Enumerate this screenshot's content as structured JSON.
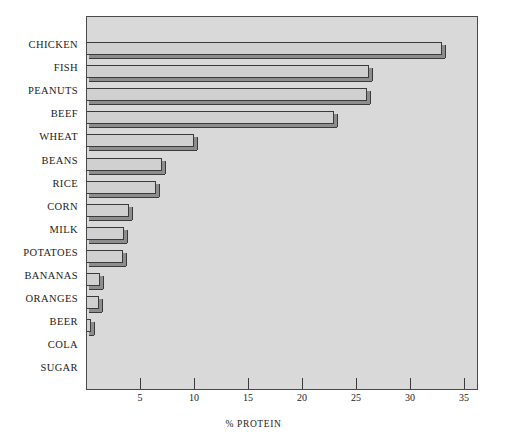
{
  "chart_data": {
    "type": "bar",
    "orientation": "horizontal",
    "title": "",
    "xlabel": "% PROTEIN",
    "ylabel": "",
    "xlim": [
      0,
      36.3
    ],
    "xticks": [
      5,
      10,
      15,
      20,
      25,
      30,
      35
    ],
    "grid": false,
    "legend": null,
    "categories": [
      "CHICKEN",
      "FISH",
      "PEANUTS",
      "BEEF",
      "WHEAT",
      "BEANS",
      "RICE",
      "CORN",
      "MILK",
      "POTATOES",
      "BANANAS",
      "ORANGES",
      "BEER",
      "COLA",
      "SUGAR"
    ],
    "values": [
      33,
      26.2,
      26,
      23,
      10,
      7,
      6.5,
      4,
      3.5,
      3.4,
      1.3,
      1.2,
      0.5,
      0,
      0
    ]
  },
  "style": {
    "plot_background": "#d9d9d9",
    "label_panel_background": "#ffffff",
    "bar_fill": "#d0d0d0",
    "bar_shadow": "#8d8d8d",
    "axis_color": "#4a4a4a",
    "text_color": "#1b1b1b"
  }
}
